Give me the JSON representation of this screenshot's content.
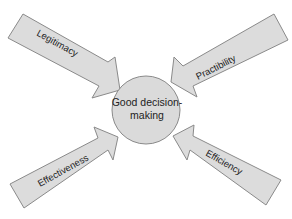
{
  "diagram": {
    "center": {
      "line1": "Good decision-",
      "line2": "making"
    },
    "arrows": [
      {
        "label": "Legitimacy",
        "position": "top-left"
      },
      {
        "label": "Practibility",
        "position": "top-right"
      },
      {
        "label": "Effectiveness",
        "position": "bottom-left"
      },
      {
        "label": "Efficiency",
        "position": "bottom-right"
      }
    ],
    "colors": {
      "fill": "#dcdcdc",
      "stroke": "#8a8a8a",
      "text": "#222222",
      "background": "#ffffff"
    }
  }
}
